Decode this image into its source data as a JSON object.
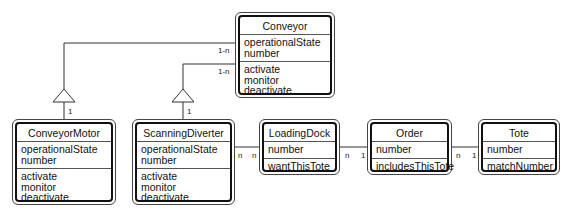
{
  "diagram": {
    "type": "UML class diagram",
    "classes": [
      {
        "id": "conveyor",
        "name": "Conveyor",
        "attributes": [
          "operationalState",
          "number"
        ],
        "operations": [
          "activate",
          "monitor",
          "deactivate"
        ]
      },
      {
        "id": "conveyorMotor",
        "name": "ConveyorMotor",
        "attributes": [
          "operationalState",
          "number"
        ],
        "operations": [
          "activate",
          "monitor",
          "deactivate"
        ]
      },
      {
        "id": "scanningDiverter",
        "name": "ScanningDiverter",
        "attributes": [
          "operationalState",
          "number"
        ],
        "operations": [
          "activate",
          "monitor",
          "deactivate"
        ]
      },
      {
        "id": "loadingDock",
        "name": "LoadingDock",
        "attributes": [
          "number"
        ],
        "operations": [
          "wantThisTote"
        ]
      },
      {
        "id": "order",
        "name": "Order",
        "attributes": [
          "number"
        ],
        "operations": [
          "includesThisTote"
        ]
      },
      {
        "id": "tote",
        "name": "Tote",
        "attributes": [
          "number"
        ],
        "operations": [
          "matchNumber"
        ]
      }
    ],
    "relationships": [
      {
        "from": "Conveyor",
        "to": "ConveyorMotor",
        "kind": "generalization",
        "mult_conveyor_end": "1-n",
        "mult_sub_end": "1"
      },
      {
        "from": "Conveyor",
        "to": "ScanningDiverter",
        "kind": "generalization",
        "mult_conveyor_end": "1-n",
        "mult_sub_end": "1"
      },
      {
        "from": "ScanningDiverter",
        "to": "LoadingDock",
        "kind": "association",
        "mult_from": "n",
        "mult_to": "n"
      },
      {
        "from": "LoadingDock",
        "to": "Order",
        "kind": "association",
        "mult_from": "n",
        "mult_to": "1"
      },
      {
        "from": "Order",
        "to": "Tote",
        "kind": "association",
        "mult_from": "n",
        "mult_to": "1"
      }
    ],
    "labels": {
      "m_conv_motor_top": "1-n",
      "m_conv_div_top": "1-n",
      "m_motor_bottom": "1",
      "m_div_bottom": "1",
      "m_div_dock_a": "n",
      "m_div_dock_b": "n",
      "m_dock_order_a": "n",
      "m_dock_order_b": "1",
      "m_order_tote_a": "n",
      "m_order_tote_b": "1"
    }
  }
}
